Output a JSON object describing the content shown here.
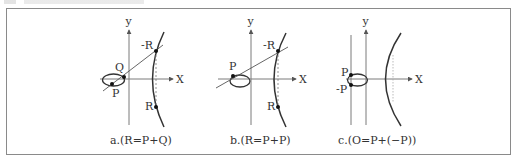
{
  "figure": {
    "colors": {
      "border": "#8a8a8a",
      "axis": "#7a7a7a",
      "curve": "#333333",
      "text": "#333333"
    },
    "panels": [
      {
        "id": "a",
        "caption": "a.(R=P+Q)",
        "axis_x_label": "X",
        "axis_y_label": "y",
        "points": [
          {
            "name": "P",
            "label": "P"
          },
          {
            "name": "Q",
            "label": "Q"
          },
          {
            "name": "-R",
            "label": "-R"
          },
          {
            "name": "R",
            "label": "R"
          }
        ]
      },
      {
        "id": "b",
        "caption": "b.(R=P+P)",
        "axis_x_label": "X",
        "axis_y_label": "y",
        "points": [
          {
            "name": "P",
            "label": "P"
          },
          {
            "name": "-R",
            "label": "-R"
          },
          {
            "name": "R",
            "label": "R"
          }
        ]
      },
      {
        "id": "c",
        "caption": "c.(O=P+(−P))",
        "axis_x_label": "X",
        "axis_y_label": "y",
        "points": [
          {
            "name": "P",
            "label": "P"
          },
          {
            "name": "-P",
            "label": "-P"
          }
        ]
      }
    ]
  }
}
